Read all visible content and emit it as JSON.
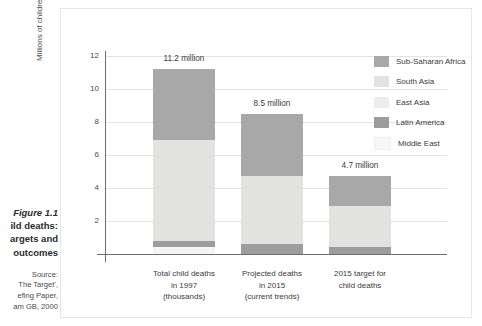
{
  "caption": {
    "figure_number": "Figure 1.1",
    "title_line2": "ild deaths:",
    "title_line3": "argets and",
    "title_line4": "outcomes",
    "source_label": "Source:",
    "source_line1": "The Target',",
    "source_line2": "efing Paper,",
    "source_line3": "am GB, 2000"
  },
  "chart_data": {
    "type": "bar",
    "stacked": true,
    "title": "",
    "xlabel": "",
    "ylabel": "Millions of children",
    "ylim": [
      0,
      12
    ],
    "yticks": [
      2,
      4,
      6,
      8,
      10,
      12
    ],
    "grid": true,
    "legend_position": "right",
    "categories": [
      "Total child deaths\nin 1997\n(thousands)",
      "Projected deaths\nin 2015\n(current trends)",
      "2015 target for\nchild deaths"
    ],
    "category_lines": [
      [
        "Total child deaths",
        "in 1997",
        "(thousands)"
      ],
      [
        "Projected deaths",
        "in 2015",
        "(current trends)"
      ],
      [
        "2015 target for",
        "child deaths"
      ]
    ],
    "totals": [
      11.2,
      8.5,
      4.7
    ],
    "total_labels": [
      "11.2 million",
      "8.5 million",
      "4.7 million"
    ],
    "series": [
      {
        "name": "Sub-Saharan Africa",
        "color": "#a8a8a8",
        "values": [
          4.3,
          3.8,
          1.8
        ]
      },
      {
        "name": "South Asia",
        "color": "#e2e2e0",
        "values": [
          6.1,
          4.1,
          2.5
        ]
      },
      {
        "name": "East Asia",
        "color": "#ededeb",
        "values": [
          0.0,
          0.0,
          0.0
        ]
      },
      {
        "name": "Latin America",
        "color": "#9d9d9d",
        "values": [
          0.4,
          0.6,
          0.4
        ]
      },
      {
        "name": "Middle East",
        "color": "#f4f4f2",
        "values": [
          0.4,
          0.0,
          0.0
        ]
      }
    ]
  },
  "legend": {
    "items": [
      {
        "label": "Sub-Saharan Africa",
        "color": "#a8a8a8"
      },
      {
        "label": "South Asia",
        "color": "#e2e2e0"
      },
      {
        "label": "East Asia",
        "color": "#ededeb"
      },
      {
        "label": "Latin America",
        "color": "#9d9d9d"
      },
      {
        "label": "Middle East",
        "color": "#f7f7f5"
      }
    ]
  },
  "axis": {
    "y_title": "Millions of children",
    "y_tick_labels": [
      "2",
      "4",
      "6",
      "8",
      "10",
      "12"
    ]
  }
}
